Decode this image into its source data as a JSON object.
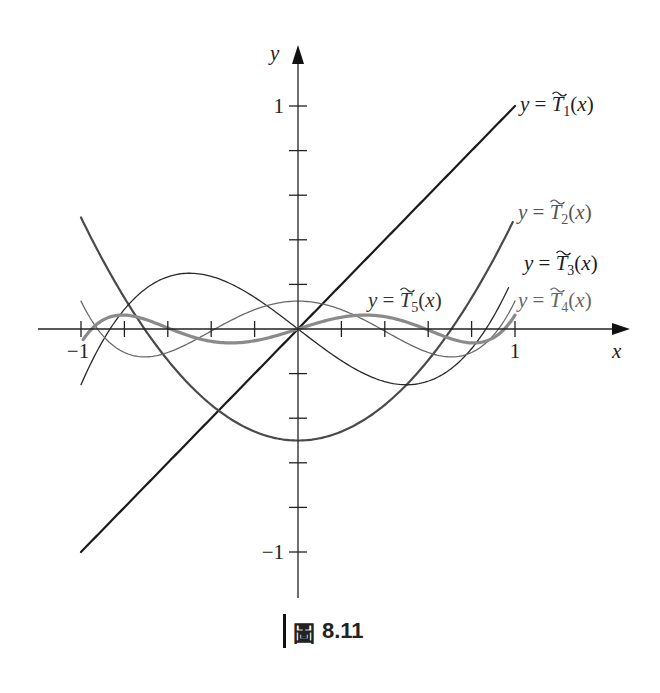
{
  "chart_data": {
    "type": "line",
    "title": "",
    "caption": {
      "figure_word": "圖",
      "number": "8.11"
    },
    "xlabel": "x",
    "ylabel": "y",
    "xlim": [
      -1,
      1
    ],
    "ylim": [
      -1,
      1
    ],
    "x_ticks": [
      -1,
      -0.8,
      -0.6,
      -0.4,
      -0.2,
      0.2,
      0.4,
      0.6,
      0.8,
      1
    ],
    "x_tick_labels": [
      {
        "value": -1,
        "text": "−1"
      },
      {
        "value": 1,
        "text": "1"
      }
    ],
    "y_ticks": [
      -1,
      -0.8,
      -0.6,
      -0.4,
      -0.2,
      0.2,
      0.4,
      0.6,
      0.8,
      1
    ],
    "y_tick_labels": [
      {
        "value": 1,
        "text": "1"
      },
      {
        "value": -1,
        "text": "−1"
      }
    ],
    "grid": false,
    "series": [
      {
        "name": "T1",
        "label_prefix": "y = ",
        "label_sub": "1",
        "formula": "x",
        "coeffs": [
          0,
          1
        ],
        "color": "#1a1a1a"
      },
      {
        "name": "T2",
        "label_prefix": "y = ",
        "label_sub": "2",
        "formula": "x^2 - 1/2",
        "coeffs": [
          -0.5,
          0,
          1
        ],
        "color": "#4a4a4a"
      },
      {
        "name": "T3",
        "label_prefix": "y = ",
        "label_sub": "3",
        "formula": "x^3 - 3x/4",
        "coeffs": [
          0,
          -0.75,
          0,
          1
        ],
        "color": "#2a2a2a"
      },
      {
        "name": "T4",
        "label_prefix": "y = ",
        "label_sub": "4",
        "formula": "x^4 - x^2 + 1/8",
        "coeffs": [
          0.125,
          0,
          -1,
          0,
          1
        ],
        "color": "#6a6a6a"
      },
      {
        "name": "T5",
        "label_prefix": "y = ",
        "label_sub": "5",
        "formula": "x^5 - 5x^3/4 + 5x/16",
        "coeffs": [
          0,
          0.3125,
          0,
          -1.25,
          0,
          1
        ],
        "color": "#8a8a8a"
      }
    ]
  }
}
